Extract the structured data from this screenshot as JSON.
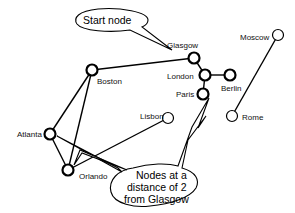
{
  "diagram": {
    "nodes": [
      {
        "id": "glasgow",
        "label": "Glasgow",
        "x": 194,
        "y": 58,
        "lx": 167,
        "ly": 48,
        "style": "bold"
      },
      {
        "id": "london",
        "label": "London",
        "x": 205,
        "y": 75,
        "lx": 167,
        "ly": 79,
        "style": "bold"
      },
      {
        "id": "berlin",
        "label": "Berlin",
        "x": 230,
        "y": 75,
        "lx": 221,
        "ly": 91,
        "style": "bold"
      },
      {
        "id": "paris",
        "label": "Paris",
        "x": 203,
        "y": 94,
        "lx": 176,
        "ly": 97,
        "style": "bold"
      },
      {
        "id": "lisbon",
        "label": "Lisbon",
        "x": 168,
        "y": 118,
        "lx": 140,
        "ly": 119,
        "style": "thin"
      },
      {
        "id": "boston",
        "label": "Boston",
        "x": 92,
        "y": 70,
        "lx": 97,
        "ly": 84,
        "style": "bold"
      },
      {
        "id": "atlanta",
        "label": "Atlanta",
        "x": 50,
        "y": 134,
        "lx": 17,
        "ly": 137,
        "style": "bold"
      },
      {
        "id": "orlando",
        "label": "Orlando",
        "x": 68,
        "y": 170,
        "lx": 79,
        "ly": 179,
        "style": "bold"
      },
      {
        "id": "moscow",
        "label": "Moscow",
        "x": 278,
        "y": 35,
        "lx": 240,
        "ly": 40,
        "style": "thin"
      },
      {
        "id": "rome",
        "label": "Rome",
        "x": 232,
        "y": 116,
        "lx": 242,
        "ly": 120,
        "style": "thin"
      }
    ],
    "edges": [
      [
        "glasgow",
        "london"
      ],
      [
        "london",
        "berlin"
      ],
      [
        "london",
        "paris"
      ],
      [
        "glasgow",
        "boston"
      ],
      [
        "boston",
        "atlanta"
      ],
      [
        "boston",
        "orlando"
      ],
      [
        "atlanta",
        "orlando"
      ],
      [
        "orlando",
        "lisbon"
      ],
      [
        "moscow",
        "rome"
      ]
    ],
    "callouts": {
      "start": {
        "text": "Start node"
      },
      "distance": {
        "lines": [
          "Nodes at a",
          "distance of 2",
          "from Glasgow"
        ]
      }
    }
  }
}
